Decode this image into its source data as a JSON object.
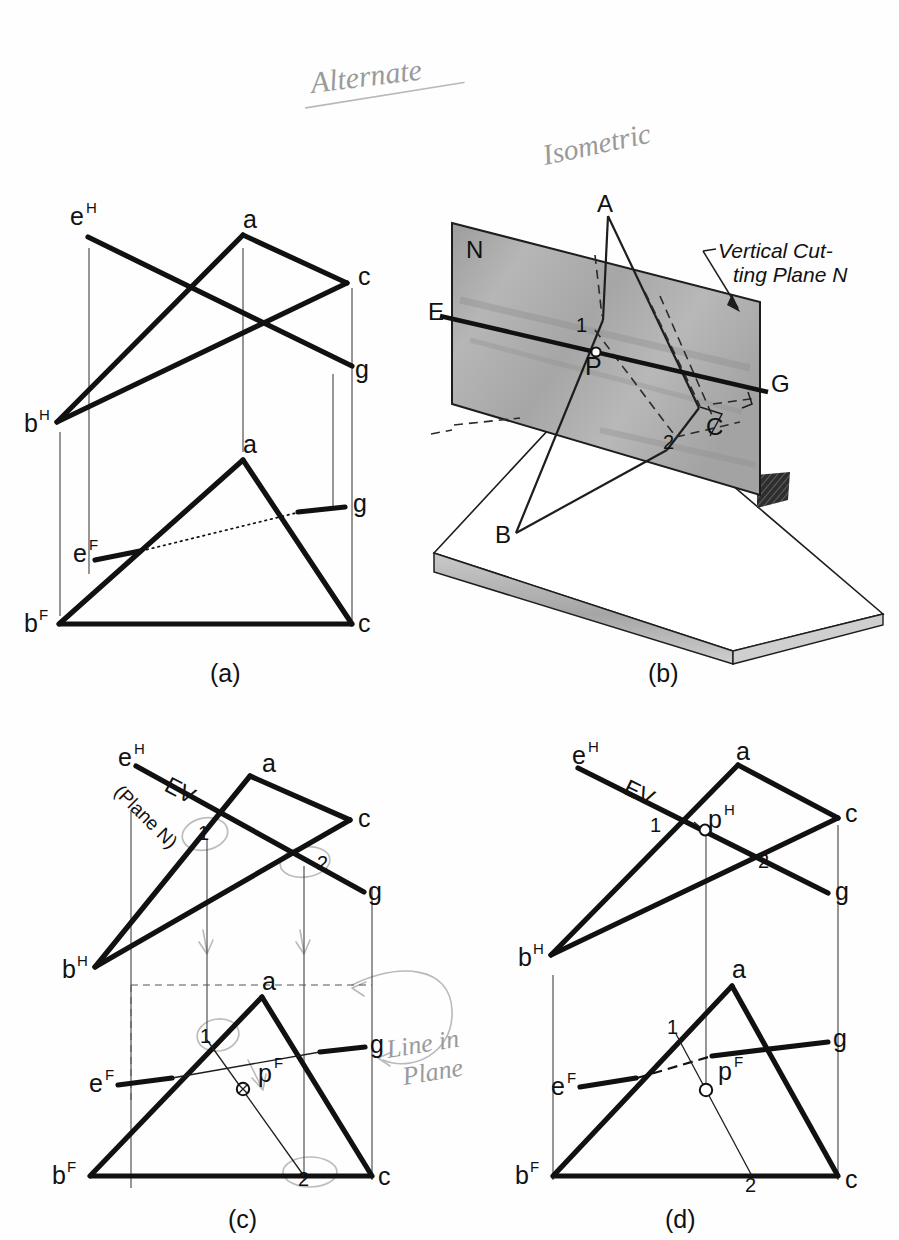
{
  "page": {
    "background": "#fefefe",
    "ink": "#111111",
    "pencil_color": "#b9b9b9",
    "plane_fill": "#b0b0b0"
  },
  "handwriting": {
    "title": "Alternate",
    "isometric": "Isometric",
    "line_in_plane_1": "Line in",
    "line_in_plane_2": "Plane"
  },
  "figures": [
    {
      "key": "a",
      "caption": "(a)",
      "description": "Given two views of plane ABC and line EG"
    },
    {
      "key": "b",
      "caption": "(b)",
      "description": "Pictorial isometric of vertical cutting plane N"
    },
    {
      "key": "c",
      "caption": "(c)",
      "description": "Edge view of cutting plane and projection of line 1-2"
    },
    {
      "key": "d",
      "caption": "(d)",
      "description": "Completed solution showing piercing point P"
    }
  ],
  "fig_a": {
    "top_view": {
      "e": "e",
      "e_sup": "H",
      "a": "a",
      "c": "c",
      "b": "b",
      "b_sup": "H",
      "g": "g"
    },
    "front_view": {
      "a": "a",
      "e": "e",
      "e_sup": "F",
      "g": "g",
      "b": "b",
      "b_sup": "F",
      "c": "c"
    }
  },
  "fig_b": {
    "plane_label": "N",
    "note_line1": "Vertical Cut-",
    "note_line2": "ting Plane N",
    "points": {
      "A": "A",
      "B": "B",
      "C": "C",
      "E": "E",
      "G": "G",
      "P": "P",
      "one": "1",
      "two": "2"
    }
  },
  "fig_c": {
    "top_view": {
      "e": "e",
      "e_sup": "H",
      "ev": "EV",
      "plane_n": "(Plane N)",
      "a": "a",
      "c": "c",
      "one": "1",
      "two": "2",
      "b": "b",
      "b_sup": "H",
      "g": "g"
    },
    "front_view": {
      "a": "a",
      "one": "1",
      "p": "p",
      "p_sup": "F",
      "g": "g",
      "e": "e",
      "e_sup": "F",
      "b": "b",
      "b_sup": "F",
      "two": "2",
      "c": "c"
    }
  },
  "fig_d": {
    "top_view": {
      "e": "e",
      "e_sup": "H",
      "ev": "EV",
      "a": "a",
      "c": "c",
      "one": "1",
      "p": "p",
      "p_sup": "H",
      "two": "2",
      "b": "b",
      "b_sup": "H",
      "g": "g"
    },
    "front_view": {
      "a": "a",
      "one": "1",
      "p": "p",
      "p_sup": "F",
      "g": "g",
      "e": "e",
      "e_sup": "F",
      "b": "b",
      "b_sup": "F",
      "two": "2",
      "c": "c"
    }
  }
}
